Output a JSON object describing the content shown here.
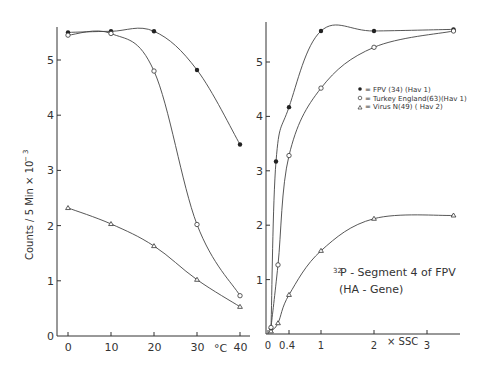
{
  "chart_data": [
    {
      "type": "line",
      "title": "",
      "xlabel": "°C",
      "ylabel": "Counts / 5 Min × 10⁻³",
      "xlim": [
        -2,
        42
      ],
      "ylim": [
        0,
        5.6
      ],
      "x_ticks": [
        0,
        10,
        20,
        30,
        40
      ],
      "y_ticks": [
        0,
        1,
        2,
        3,
        4,
        5
      ],
      "grid": false,
      "series": [
        {
          "name": "FPV (34) (Hav 1)",
          "marker": "filled-circle",
          "x": [
            0,
            10,
            20,
            30,
            40
          ],
          "values": [
            5.5,
            5.52,
            5.52,
            4.82,
            3.47
          ]
        },
        {
          "name": "Turkey England (63) (Hav 1)",
          "marker": "open-circle",
          "x": [
            0,
            10,
            20,
            30,
            40
          ],
          "values": [
            5.45,
            5.48,
            4.8,
            2.02,
            0.73
          ]
        },
        {
          "name": "Virus N (49) (Hav 2)",
          "marker": "triangle",
          "x": [
            0,
            10,
            20,
            30,
            40
          ],
          "values": [
            2.32,
            2.03,
            1.63,
            1.02,
            0.53
          ]
        }
      ]
    },
    {
      "type": "line",
      "title": "",
      "xlabel": "× SSC",
      "ylabel": "",
      "xlim": [
        0,
        3.9
      ],
      "ylim": [
        0,
        5.6
      ],
      "x_ticks": [
        0,
        0.4,
        1,
        2,
        3
      ],
      "y_ticks": [
        1,
        2,
        3,
        4,
        5
      ],
      "grid": false,
      "annotation": "32P-Segment 4 of FPV (HA-Gene)",
      "legend_position": "upper-right-inside",
      "series": [
        {
          "name": "FPV (34) (Hav 1)",
          "marker": "filled-circle",
          "x": [
            0.05,
            0.15,
            0.4,
            1,
            2,
            3.5
          ],
          "values": [
            0.1,
            3.17,
            4.17,
            5.57,
            5.57,
            5.6
          ]
        },
        {
          "name": "Turkey England (63) (Hav 1)",
          "marker": "open-circle",
          "x": [
            0.05,
            0.2,
            0.4,
            1,
            2,
            3.5
          ],
          "values": [
            0.12,
            1.27,
            3.28,
            4.52,
            5.27,
            5.57
          ]
        },
        {
          "name": "Virus N (49) (Hav 2)",
          "marker": "triangle",
          "x": [
            0.05,
            0.2,
            0.4,
            1,
            2,
            3.5
          ],
          "values": [
            0.05,
            0.2,
            0.72,
            1.53,
            2.12,
            2.18
          ]
        }
      ]
    }
  ],
  "left": {
    "ylabel": "Counts / 5 Min × 10",
    "ylabel_exp": "− 3",
    "y_ticks": [
      "0",
      "1",
      "2",
      "3",
      "4",
      "5"
    ],
    "x_ticks": [
      "0",
      "10",
      "20",
      "30",
      "40"
    ],
    "x_unit": "°C"
  },
  "right": {
    "y_ticks": [
      "1",
      "2",
      "3",
      "4",
      "5"
    ],
    "x_ticks": [
      "0",
      "0.4",
      "1",
      "2",
      "3"
    ],
    "x_unit": "× SSC",
    "annotation_sup": "32",
    "annotation_line1": "P - Segment 4 of  FPV",
    "annotation_line2": "(HA - Gene)"
  },
  "legend": [
    {
      "symbol": "●",
      "label": "= FPV (34) (Hav 1)"
    },
    {
      "symbol": "○",
      "label": "= Turkey England(63)(Hav 1)"
    },
    {
      "symbol": "△",
      "label": "= Virus N(49) ( Hav 2)"
    }
  ]
}
